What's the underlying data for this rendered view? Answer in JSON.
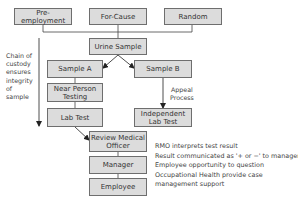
{
  "diagram": {
    "triggers": [
      {
        "id": "pre-employment",
        "label": "Pre-employment"
      },
      {
        "id": "for-cause",
        "label": "For-Cause"
      },
      {
        "id": "random",
        "label": "Random"
      }
    ],
    "nodes": {
      "urine_sample": "Urine Sample",
      "sample_a": "Sample A",
      "sample_b": "Sample B",
      "near_person_testing_1": "Near Person",
      "near_person_testing_2": "Testing",
      "lab_test": "Lab Test",
      "independent_lab_test_1": "Independent",
      "independent_lab_test_2": "Lab Test",
      "review_medical_officer_1": "Review Medical",
      "review_medical_officer_2": "Officer",
      "manager": "Manager",
      "employee": "Employee"
    },
    "chain_of_custody": [
      "Chain of",
      "custody",
      "ensures",
      "integrity",
      "of",
      "sample"
    ],
    "appeal_process": [
      "Appeal",
      "Process"
    ],
    "notes": [
      "RMO interprets test result",
      "Result communicated as '+ or −' to manager",
      "Employee opportunity to question",
      "Occupational Health provide case",
      "management support"
    ],
    "colors": {
      "box_fill": "#dcdcdc",
      "box_border": "#6e6e6e",
      "line": "#333333"
    }
  }
}
